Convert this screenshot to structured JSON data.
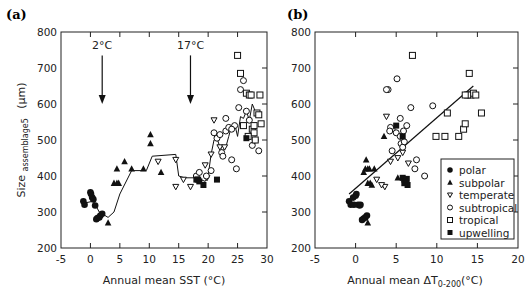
{
  "chart_data": [
    {
      "panel": "(a)",
      "type": "scatter",
      "title": "",
      "xlabel": "Annual mean SST (°C)",
      "ylabel": "Size assemblage5 (μm)",
      "ylabel_main": "Size",
      "ylabel_sub": "assemblage5",
      "ylabel_unit": "(μm)",
      "xlim": [
        -5,
        30
      ],
      "ylim": [
        200,
        800
      ],
      "xticks": [
        -5,
        0,
        5,
        10,
        15,
        20,
        25,
        30
      ],
      "yticks": [
        200,
        300,
        400,
        500,
        600,
        700,
        800
      ],
      "grid": false,
      "annotations": [
        {
          "text": "2°C",
          "x": 2,
          "arrow_from": 735,
          "arrow_to": 600
        },
        {
          "text": "17°C",
          "x": 17,
          "arrow_from": 735,
          "arrow_to": 600
        }
      ],
      "line": {
        "name": "running mean",
        "x": [
          -1,
          0.5,
          1.5,
          3,
          4,
          5,
          7,
          9.5,
          10.5,
          14.5,
          15,
          16,
          18,
          19.5,
          20,
          20.5,
          21,
          21.5,
          22,
          22.5,
          23,
          23.5,
          24,
          24.5,
          25,
          25.5,
          26,
          26.5,
          27,
          27.5,
          28,
          28.5
        ],
        "y": [
          325,
          330,
          300,
          285,
          300,
          350,
          415,
          415,
          455,
          460,
          400,
          395,
          395,
          385,
          400,
          460,
          500,
          505,
          480,
          470,
          480,
          510,
          540,
          545,
          510,
          565,
          560,
          580,
          555,
          600,
          580,
          565
        ]
      },
      "series": [
        {
          "name": "polar",
          "marker": "filled-circle",
          "x": [
            -1.2,
            -1.0,
            0.1,
            0.3,
            0.5,
            0.8,
            1.0,
            1.2,
            1.5,
            1.7,
            2.0,
            0.0
          ],
          "y": [
            330,
            320,
            350,
            340,
            335,
            318,
            280,
            283,
            285,
            290,
            295,
            355
          ]
        },
        {
          "name": "subpolar",
          "marker": "filled-triangle-up",
          "x": [
            3.0,
            4.0,
            4.5,
            4.8,
            5.8,
            7.0,
            9.0,
            10.2,
            10.2,
            12.0,
            4.5
          ],
          "y": [
            270,
            380,
            420,
            380,
            440,
            420,
            420,
            515,
            490,
            410,
            380
          ]
        },
        {
          "name": "temperate",
          "marker": "open-triangle-down",
          "x": [
            11.5,
            14.5,
            15.8,
            14.5,
            19.5,
            19.8,
            20.5,
            21.0,
            22.0,
            22.8,
            17.0
          ],
          "y": [
            440,
            445,
            390,
            370,
            430,
            395,
            460,
            555,
            480,
            480,
            370
          ]
        },
        {
          "name": "subtropical",
          "marker": "open-circle",
          "x": [
            18.0,
            18.5,
            19.7,
            20.5,
            21.0,
            21.5,
            22.0,
            22.3,
            22.5,
            23.0,
            23.5,
            24.0,
            24.5,
            24.8,
            25.2,
            25.5,
            26.0,
            26.5,
            27.0,
            27.5,
            28.0,
            28.6,
            23.0,
            24.0
          ],
          "y": [
            400,
            410,
            400,
            415,
            520,
            505,
            515,
            465,
            455,
            525,
            535,
            445,
            540,
            420,
            590,
            640,
            665,
            580,
            555,
            485,
            500,
            470,
            560,
            530
          ]
        },
        {
          "name": "tropical",
          "marker": "open-square",
          "x": [
            25.0,
            25.5,
            26.0,
            26.5,
            27.0,
            27.3,
            27.5,
            27.8,
            28.0,
            28.3,
            28.6,
            29.0,
            26.8,
            27.8,
            28.8
          ],
          "y": [
            735,
            685,
            540,
            630,
            625,
            625,
            530,
            520,
            500,
            575,
            570,
            545,
            510,
            540,
            625
          ]
        },
        {
          "name": "upwelling",
          "marker": "filled-square",
          "x": [
            18.0,
            18.3,
            19.2,
            21.5,
            18.5,
            26.5
          ],
          "y": [
            390,
            390,
            375,
            390,
            385,
            505
          ]
        }
      ]
    },
    {
      "panel": "(b)",
      "type": "scatter",
      "title": "",
      "xlabel": "Annual mean  ΔT0-200(°C)",
      "xlabel_main": "Annual mean  ΔT",
      "xlabel_sub": "0-200",
      "xlabel_unit": "(°C)",
      "ylabel": "",
      "xlim": [
        -5,
        20
      ],
      "ylim": [
        200,
        800
      ],
      "xticks": [
        -5,
        0,
        5,
        10,
        15,
        20
      ],
      "yticks": [
        200,
        300,
        400,
        500,
        600,
        700,
        800
      ],
      "grid": false,
      "legend_position": "lower right (inside)",
      "trendline": {
        "x": [
          -0.8,
          14.5
        ],
        "y": [
          350,
          650
        ]
      },
      "series": [
        {
          "name": "polar",
          "marker": "filled-circle",
          "x": [
            -0.8,
            -0.6,
            -0.3,
            0.0,
            0.1,
            0.3,
            0.5,
            0.6,
            0.8,
            1.0,
            1.2,
            1.4,
            -0.2
          ],
          "y": [
            330,
            320,
            340,
            345,
            350,
            320,
            318,
            320,
            278,
            282,
            285,
            290,
            320
          ]
        },
        {
          "name": "subpolar",
          "marker": "filled-triangle-up",
          "x": [
            1.0,
            1.2,
            1.3,
            1.5,
            1.8,
            2.0,
            2.3,
            3.5,
            1.5,
            5.2,
            1.5,
            1.7
          ],
          "y": [
            410,
            420,
            445,
            420,
            380,
            375,
            420,
            510,
            270,
            395,
            380,
            420
          ]
        },
        {
          "name": "temperate",
          "marker": "open-triangle-down",
          "x": [
            2.6,
            3.6,
            4.3,
            5.2,
            5.8,
            6.5,
            3.8,
            3.2
          ],
          "y": [
            390,
            370,
            440,
            450,
            465,
            435,
            565,
            375
          ]
        },
        {
          "name": "subtropical",
          "marker": "open-circle",
          "x": [
            4.0,
            4.5,
            5.0,
            5.5,
            5.6,
            5.8,
            6.0,
            6.3,
            7.3,
            7.5,
            8.5,
            3.8,
            5.1,
            6.8,
            4.5,
            5.5,
            5.9,
            4.3,
            4.2,
            9.5
          ],
          "y": [
            640,
            530,
            520,
            560,
            490,
            480,
            495,
            540,
            420,
            445,
            400,
            640,
            670,
            590,
            470,
            510,
            525,
            535,
            525,
            595
          ]
        },
        {
          "name": "tropical",
          "marker": "open-square",
          "x": [
            7.0,
            11.3,
            9.9,
            12.7,
            13.3,
            13.5,
            14.0,
            14.2,
            14.5,
            13.8,
            15.5,
            13.5,
            14.8,
            11.0
          ],
          "y": [
            735,
            575,
            510,
            510,
            530,
            545,
            685,
            625,
            630,
            625,
            575,
            625,
            625,
            510
          ]
        },
        {
          "name": "upwelling",
          "marker": "filled-square",
          "x": [
            5.8,
            6.0,
            6.2,
            6.4,
            6.0,
            6.3,
            5.0,
            5.8
          ],
          "y": [
            395,
            390,
            385,
            375,
            380,
            392,
            540,
            510
          ]
        }
      ]
    }
  ],
  "figure": {
    "panel_a_label": "(a)",
    "panel_b_label": "(b)",
    "legend": [
      {
        "name": "polar",
        "marker": "filled-circle"
      },
      {
        "name": "subpolar",
        "marker": "filled-triangle-up"
      },
      {
        "name": "temperate",
        "marker": "open-triangle-down"
      },
      {
        "name": "subtropical",
        "marker": "open-circle"
      },
      {
        "name": "tropical",
        "marker": "open-square"
      },
      {
        "name": "upwelling",
        "marker": "filled-square"
      }
    ]
  }
}
